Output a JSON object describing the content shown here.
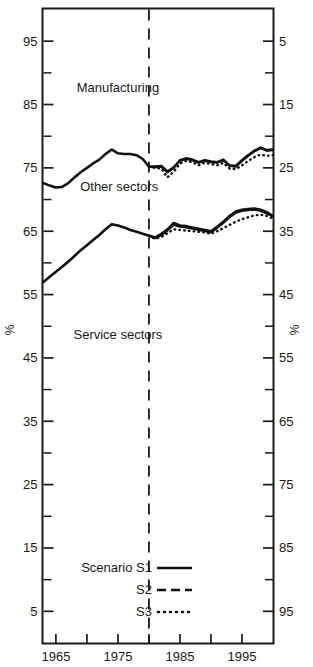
{
  "chart_data": {
    "type": "line",
    "title": "",
    "xlabel": "",
    "ylabel": "%",
    "ylabel_right": "%",
    "xlim": [
      1963,
      2000
    ],
    "ylim": [
      0,
      100
    ],
    "ylim_right": [
      100,
      0
    ],
    "grid": false,
    "legend_position": "bottom-left",
    "xticks": [
      1965,
      1970,
      1975,
      1980,
      1985,
      1990,
      1995
    ],
    "xtick_labels": [
      "1965",
      "",
      "1975",
      "",
      "1985",
      "",
      "1995"
    ],
    "yticks_left": [
      95,
      85,
      75,
      65,
      55,
      45,
      35,
      25,
      15,
      5
    ],
    "ytick_labels_left": [
      "95",
      "85",
      "75",
      "65",
      "55",
      "45",
      "35",
      "25",
      "15",
      "5"
    ],
    "yticks_right": [
      5,
      15,
      25,
      35,
      45,
      55,
      65,
      75,
      85,
      95
    ],
    "ytick_labels_right": [
      "5",
      "15",
      "25",
      "35",
      "45",
      "55",
      "65",
      "75",
      "85",
      "95"
    ],
    "yticks_minor_left": [
      90,
      80,
      70,
      60,
      50,
      40,
      30,
      20,
      10
    ],
    "annotations": [
      {
        "text": "Manufacturing",
        "x": 1975.0,
        "y": 87.0
      },
      {
        "text": "Other sectors",
        "x": 1975.2,
        "y": 71.3
      },
      {
        "text": "Service sectors",
        "x": 1975.0,
        "y": 48.0
      }
    ],
    "divider_year": 1980,
    "legend": [
      {
        "label": "Scenario S1",
        "style": "solid"
      },
      {
        "label": "S2",
        "style": "dashed"
      },
      {
        "label": "S3",
        "style": "dotted"
      }
    ],
    "series": [
      {
        "name": "Other sectors S1",
        "group": "other-sectors",
        "scenario": "S1",
        "style": "solid",
        "x": [
          1963.0,
          1964.0,
          1965.0,
          1966.0,
          1967.0,
          1968.0,
          1969.0,
          1970.0,
          1971.0,
          1972.0,
          1973.0,
          1974.0,
          1975.0,
          1976.0,
          1977.0,
          1978.0,
          1979.0,
          1980.0,
          1981.0,
          1982.0,
          1983.0,
          1984.0,
          1985.0,
          1986.0,
          1987.0,
          1988.0,
          1989.0,
          1990.0,
          1991.0,
          1992.0,
          1993.0,
          1994.0,
          1995.0,
          1996.0,
          1997.0,
          1998.0,
          1999.0,
          2000.0
        ],
        "y": [
          72.6,
          72.2,
          71.9,
          72.0,
          72.6,
          73.5,
          74.3,
          75.0,
          75.7,
          76.3,
          77.2,
          77.9,
          77.3,
          77.2,
          77.2,
          77.0,
          76.4,
          75.2,
          75.2,
          75.3,
          74.4,
          75.1,
          76.2,
          76.5,
          76.3,
          75.9,
          76.2,
          76.0,
          75.9,
          76.3,
          75.4,
          75.3,
          76.2,
          77.0,
          77.7,
          78.2,
          77.8,
          77.9
        ]
      },
      {
        "name": "Other sectors S2",
        "group": "other-sectors",
        "scenario": "S2",
        "style": "dashed",
        "x": [
          1980.0,
          1981.0,
          1982.0,
          1983.0,
          1984.0,
          1985.0,
          1986.0,
          1987.0,
          1988.0,
          1989.0,
          1990.0,
          1991.0,
          1992.0,
          1993.0,
          1994.0,
          1995.0,
          1996.0,
          1997.0,
          1998.0,
          1999.0,
          2000.0
        ],
        "y": [
          75.2,
          75.1,
          75.2,
          74.3,
          75.0,
          76.1,
          76.4,
          76.2,
          75.8,
          76.1,
          75.9,
          75.8,
          76.2,
          75.3,
          75.2,
          76.1,
          76.9,
          77.6,
          78.1,
          77.7,
          77.8
        ]
      },
      {
        "name": "Other sectors S3",
        "group": "other-sectors",
        "scenario": "S3",
        "style": "dotted",
        "x": [
          1980.0,
          1981.0,
          1982.0,
          1983.0,
          1984.0,
          1985.0,
          1986.0,
          1987.0,
          1988.0,
          1989.0,
          1990.0,
          1991.0,
          1992.0,
          1993.0,
          1994.0,
          1995.0,
          1996.0,
          1997.0,
          1998.0,
          1999.0,
          2000.0
        ],
        "y": [
          75.2,
          75.0,
          74.9,
          73.5,
          74.4,
          75.7,
          76.1,
          75.9,
          75.4,
          75.8,
          75.6,
          75.4,
          75.8,
          74.9,
          74.8,
          75.4,
          76.1,
          76.7,
          77.1,
          76.9,
          77.0
        ]
      },
      {
        "name": "Service sectors S1",
        "group": "service-sectors",
        "scenario": "S1",
        "style": "solid",
        "x": [
          1963.0,
          1964.0,
          1965.0,
          1966.0,
          1967.0,
          1968.0,
          1969.0,
          1970.0,
          1971.0,
          1972.0,
          1973.0,
          1974.0,
          1975.0,
          1976.0,
          1977.0,
          1978.0,
          1979.0,
          1980.0,
          1981.0,
          1982.0,
          1983.0,
          1984.0,
          1985.0,
          1986.0,
          1987.0,
          1988.0,
          1989.0,
          1990.0,
          1991.0,
          1992.0,
          1993.0,
          1994.0,
          1995.0,
          1996.0,
          1997.0,
          1998.0,
          1999.0,
          2000.0
        ],
        "y": [
          57.0,
          57.8,
          58.6,
          59.4,
          60.2,
          61.1,
          62.0,
          62.8,
          63.6,
          64.4,
          65.3,
          66.1,
          65.9,
          65.6,
          65.2,
          64.9,
          64.6,
          64.3,
          64.0,
          64.6,
          65.3,
          66.3,
          65.9,
          65.8,
          65.6,
          65.4,
          65.2,
          65.0,
          65.7,
          66.5,
          67.4,
          68.1,
          68.4,
          68.5,
          68.6,
          68.4,
          68.0,
          67.4
        ]
      },
      {
        "name": "Service sectors S2",
        "group": "service-sectors",
        "scenario": "S2",
        "style": "dashed",
        "x": [
          1980.0,
          1981.0,
          1982.0,
          1983.0,
          1984.0,
          1985.0,
          1986.0,
          1987.0,
          1988.0,
          1989.0,
          1990.0,
          1991.0,
          1992.0,
          1993.0,
          1994.0,
          1995.0,
          1996.0,
          1997.0,
          1998.0,
          1999.0,
          2000.0
        ],
        "y": [
          64.3,
          63.9,
          64.4,
          65.1,
          66.0,
          65.7,
          65.6,
          65.4,
          65.2,
          65.0,
          64.8,
          65.5,
          66.3,
          67.2,
          67.9,
          68.2,
          68.3,
          68.4,
          68.2,
          67.8,
          67.3
        ]
      },
      {
        "name": "Service sectors S3",
        "group": "service-sectors",
        "scenario": "S3",
        "style": "dotted",
        "x": [
          1980.0,
          1981.0,
          1982.0,
          1983.0,
          1984.0,
          1985.0,
          1986.0,
          1987.0,
          1988.0,
          1989.0,
          1990.0,
          1991.0,
          1992.0,
          1993.0,
          1994.0,
          1995.0,
          1996.0,
          1997.0,
          1998.0,
          1999.0,
          2000.0
        ],
        "y": [
          64.3,
          63.8,
          64.1,
          64.7,
          65.3,
          65.2,
          65.1,
          65.0,
          64.9,
          64.8,
          64.6,
          65.0,
          65.5,
          66.0,
          66.5,
          66.9,
          67.2,
          67.5,
          67.6,
          67.4,
          67.0
        ]
      }
    ]
  },
  "axis": {
    "left_unit": "%",
    "right_unit": "%"
  },
  "legend": {
    "s1_label": "Scenario S1",
    "s2_label": "S2",
    "s3_label": "S3"
  },
  "labels": {
    "manufacturing": "Manufacturing",
    "other_sectors": "Other sectors",
    "service_sectors": "Service sectors"
  }
}
